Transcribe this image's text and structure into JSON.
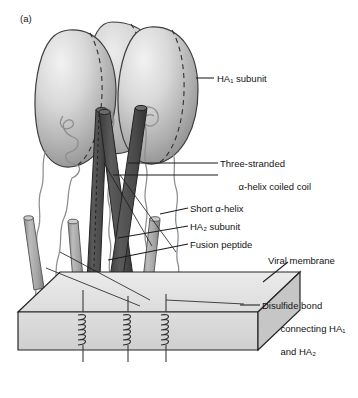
{
  "figure": {
    "panel_letter": "(a)"
  },
  "labels": {
    "ha1_subunit": "HA₁ subunit",
    "three_stranded_line1": "Three-stranded",
    "three_stranded_line2": "α-helix coiled coil",
    "short_helix": "Short α-helix",
    "ha2_subunit": "HA₂ subunit",
    "fusion_peptide": "Fusion peptide",
    "viral_membrane": "Viral membrane",
    "disulfide_line1": "Disulfide bond",
    "disulfide_line2": "connecting HA₁",
    "disulfide_line3": "and HA₂"
  },
  "colors": {
    "background": "#ffffff",
    "ink": "#141414",
    "globular_head_light": "#e9e9e9",
    "globular_head_mid": "#bdbdbd",
    "globular_head_dark": "#8e8e8e",
    "globular_outline": "#3a3a3a",
    "coiled_coil_rod": "#4f4f4f",
    "coiled_coil_rod_shade": "#3a3a3a",
    "short_helix_rod": "#a6a6a6",
    "short_helix_rod_shade": "#7e7e7e",
    "membrane_top_face": "#e4e4e4",
    "membrane_front_face": "#d6d6d6",
    "membrane_side_face": "#c4c4c4",
    "membrane_outline": "#2b2b2b",
    "chain_trace": "#8a8a8a",
    "leader_line": "#1b1b1b"
  },
  "structure": {
    "globular_heads": 3,
    "coiled_coil_rods": 3,
    "short_helices": 3,
    "transmembrane_coils": 3
  }
}
